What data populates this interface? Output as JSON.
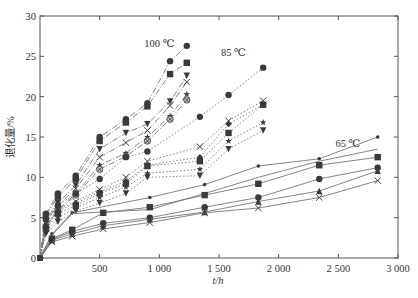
{
  "chart_data": {
    "type": "line",
    "title": "",
    "xlabel": "t/h",
    "ylabel": "退化量/%",
    "xlim": [
      0,
      3000
    ],
    "ylim": [
      0,
      30
    ],
    "xticks": [
      500,
      1000,
      1500,
      2000,
      2500,
      3000
    ],
    "xtick_labels": [
      "500",
      "1 000",
      "1 500",
      "2 000",
      "2 500",
      "3 000"
    ],
    "yticks": [
      0,
      5,
      10,
      15,
      20,
      25,
      30
    ],
    "ytick_labels": [
      "0",
      "5",
      "10",
      "15",
      "20",
      "25",
      "30"
    ],
    "grid": false,
    "legend": null,
    "annotations": [
      {
        "text": "100 ℃",
        "x": 1000,
        "y": 26.2
      },
      {
        "text": "85 ℃",
        "x": 1620,
        "y": 25.0
      },
      {
        "text": "65 ℃",
        "x": 2580,
        "y": 13.7
      }
    ],
    "groups": [
      {
        "name": "100 ℃",
        "line_style": "dashdot",
        "series": [
          {
            "marker": "circle",
            "x": [
              0,
              50,
              150,
              300,
              500,
              720,
              900,
              1090,
              1230
            ],
            "y": [
              0,
              5.5,
              8.0,
              10.2,
              15.0,
              17.2,
              19.2,
              24.4,
              26.3
            ]
          },
          {
            "marker": "square",
            "x": [
              0,
              50,
              150,
              300,
              500,
              720,
              900,
              1090,
              1230
            ],
            "y": [
              0,
              5.3,
              7.6,
              9.8,
              14.5,
              16.8,
              18.8,
              22.8,
              24.2
            ]
          },
          {
            "marker": "triangle-down",
            "x": [
              0,
              50,
              150,
              300,
              500,
              720,
              900,
              1090,
              1230
            ],
            "y": [
              0,
              4.8,
              6.8,
              9.0,
              13.5,
              15.5,
              16.6,
              19.4,
              22.6
            ]
          },
          {
            "marker": "x",
            "x": [
              0,
              50,
              150,
              300,
              500,
              720,
              900,
              1090,
              1230
            ],
            "y": [
              0,
              4.5,
              6.5,
              8.6,
              12.5,
              14.3,
              15.8,
              18.9,
              21.8
            ]
          },
          {
            "marker": "star",
            "x": [
              0,
              50,
              150,
              300,
              500,
              720,
              900,
              1090,
              1230
            ],
            "y": [
              0,
              4.0,
              6.0,
              8.0,
              11.5,
              13.0,
              15.0,
              17.6,
              20.3
            ]
          },
          {
            "marker": "circle-x",
            "x": [
              0,
              50,
              150,
              300,
              500,
              720,
              900,
              1090,
              1230
            ],
            "y": [
              0,
              3.8,
              5.8,
              7.8,
              11.0,
              12.6,
              14.5,
              17.2,
              19.6
            ]
          }
        ]
      },
      {
        "name": "85 ℃",
        "line_style": "dotted",
        "series": [
          {
            "marker": "circle",
            "x": [
              0,
              50,
              150,
              300,
              500,
              720,
              900,
              1340,
              1580,
              1870
            ],
            "y": [
              0,
              4.8,
              6.5,
              8.0,
              9.8,
              12.5,
              13.2,
              17.5,
              20.2,
              23.6
            ]
          },
          {
            "marker": "x",
            "x": [
              0,
              50,
              150,
              300,
              500,
              720,
              900,
              1340,
              1580,
              1870
            ],
            "y": [
              0,
              4.2,
              6.0,
              7.0,
              8.5,
              10.0,
              12.0,
              13.8,
              17.0,
              19.5
            ]
          },
          {
            "marker": "diamond",
            "x": [
              0,
              50,
              150,
              300,
              500,
              720,
              900,
              1340,
              1580,
              1870
            ],
            "y": [
              0,
              4.0,
              5.8,
              6.8,
              8.2,
              9.5,
              11.5,
              12.5,
              16.6,
              19.0
            ]
          },
          {
            "marker": "square",
            "x": [
              0,
              50,
              150,
              300,
              500,
              720,
              900,
              1340,
              1580,
              1870
            ],
            "y": [
              0,
              3.6,
              5.5,
              6.5,
              8.0,
              9.2,
              11.4,
              12.0,
              15.5,
              19.0
            ]
          },
          {
            "marker": "star",
            "x": [
              0,
              50,
              150,
              300,
              500,
              720,
              900,
              1340,
              1580,
              1870
            ],
            "y": [
              0,
              3.3,
              5.0,
              6.2,
              7.5,
              8.8,
              10.5,
              11.0,
              14.5,
              16.8
            ]
          },
          {
            "marker": "triangle-down",
            "x": [
              0,
              50,
              150,
              300,
              500,
              720,
              900,
              1340,
              1580,
              1870
            ],
            "y": [
              0,
              3.0,
              4.5,
              5.8,
              6.8,
              8.0,
              10.0,
              10.2,
              13.5,
              15.8
            ]
          }
        ]
      },
      {
        "name": "65 ℃",
        "line_style": "solid",
        "series": [
          {
            "marker": "dot",
            "x": [
              0,
              100,
              270,
              920,
              1380,
              1830,
              2340,
              2830
            ],
            "y": [
              0,
              3.0,
              5.6,
              7.5,
              9.1,
              11.4,
              12.3,
              15.0
            ]
          },
          {
            "marker": "none",
            "x": [
              0,
              100,
              270,
              920,
              1380,
              1830,
              2340,
              2830
            ],
            "y": [
              0,
              2.8,
              5.5,
              6.0,
              8.0,
              10.0,
              12.0,
              13.5
            ]
          },
          {
            "marker": "square",
            "x": [
              0,
              100,
              270,
              530,
              920,
              1380,
              1830,
              2340,
              2830
            ],
            "y": [
              0,
              2.4,
              3.5,
              5.6,
              6.3,
              7.8,
              9.2,
              11.5,
              12.5
            ]
          },
          {
            "marker": "circle",
            "x": [
              0,
              100,
              270,
              530,
              920,
              1380,
              1830,
              2340,
              2830
            ],
            "y": [
              0,
              2.3,
              3.3,
              4.3,
              5.0,
              6.3,
              7.5,
              9.8,
              11.2
            ]
          },
          {
            "marker": "triangle-up",
            "x": [
              0,
              100,
              270,
              530,
              920,
              1380,
              1830,
              2340,
              2830
            ],
            "y": [
              0,
              2.2,
              3.0,
              4.0,
              4.8,
              5.7,
              7.0,
              8.3,
              10.8
            ]
          },
          {
            "marker": "x",
            "x": [
              0,
              100,
              270,
              530,
              920,
              1380,
              1830,
              2340,
              2830
            ],
            "y": [
              0,
              2.0,
              2.7,
              3.6,
              4.4,
              5.6,
              6.2,
              7.5,
              9.6
            ]
          }
        ]
      }
    ]
  }
}
